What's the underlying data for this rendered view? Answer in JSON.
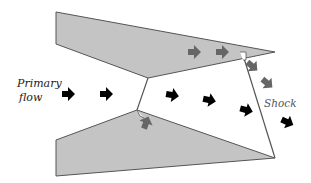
{
  "labels": {
    "primary_line1": "Primary",
    "primary_line2": "flow",
    "shock": "Shock"
  },
  "colors": {
    "wall_fill": "#c4c4c4",
    "wall_stroke": "#555555",
    "primary_arrow": "#000000",
    "secondary_arrow": "#666666",
    "shock_line": "#555555",
    "background": "#ffffff"
  },
  "elements": {
    "upper_wall": "nozzle-wall-upper",
    "lower_wall": "nozzle-wall-lower",
    "arrows": {
      "primary_count": 7,
      "secondary_count": 5
    }
  }
}
